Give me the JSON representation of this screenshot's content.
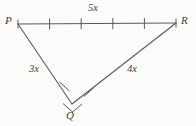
{
  "figure": {
    "type": "triangle-diagram",
    "background_color": "#fbfbfa",
    "stroke_color": "#5a5a5a",
    "text_color": "#3b3b3b",
    "width": 196,
    "height": 126,
    "vertices": [
      {
        "name": "P",
        "label": "P",
        "x": 18,
        "y": 24,
        "label_x": 5,
        "label_y": 15
      },
      {
        "name": "R",
        "label": "R",
        "x": 176,
        "y": 23,
        "label_x": 181,
        "label_y": 15
      },
      {
        "name": "Q",
        "label": "Q",
        "x": 72,
        "y": 104,
        "label_x": 66,
        "label_y": 110
      }
    ],
    "sides": [
      {
        "name": "PR",
        "from": "P",
        "to": "R",
        "label": "5x",
        "label_x": 88,
        "label_y": 3,
        "tick_count": 4,
        "tick_style": "equal-division",
        "divisions": 5
      },
      {
        "name": "PQ",
        "from": "P",
        "to": "Q",
        "label": "3x",
        "label_x": 29,
        "label_y": 64,
        "tick_count": 1,
        "tick_style": "single-hash-near-Q"
      },
      {
        "name": "QR",
        "from": "Q",
        "to": "R",
        "label": "4x",
        "label_x": 127,
        "label_y": 64,
        "tick_count": 1,
        "tick_style": "single-hash-near-Q"
      }
    ],
    "vertex_marks": [
      {
        "name": "P-endpoint-tick",
        "x": 18,
        "y": 24
      },
      {
        "name": "R-endpoint-tick",
        "x": 176,
        "y": 23
      },
      {
        "name": "Q-cross-ticks",
        "x": 72,
        "y": 104
      }
    ]
  }
}
